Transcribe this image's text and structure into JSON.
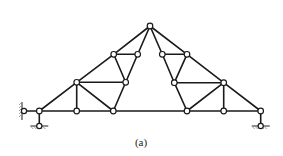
{
  "figure": {
    "caption": "(a)",
    "type": "roof-truss",
    "colors": {
      "line": "#1a1a1a",
      "joint_fill": "#ffffff",
      "background": "#ffffff"
    }
  },
  "truss": {
    "joints": [
      {
        "id": "A",
        "x": 39.3,
        "y": 111
      },
      {
        "id": "B",
        "x": 76.7,
        "y": 111
      },
      {
        "id": "C",
        "x": 113.3,
        "y": 111
      },
      {
        "id": "D",
        "x": 187,
        "y": 111
      },
      {
        "id": "E",
        "x": 223.7,
        "y": 111
      },
      {
        "id": "F",
        "x": 260.7,
        "y": 111
      },
      {
        "id": "G",
        "x": 76.7,
        "y": 82.3
      },
      {
        "id": "H",
        "x": 125.7,
        "y": 82.3
      },
      {
        "id": "I",
        "x": 174.3,
        "y": 82.7
      },
      {
        "id": "J",
        "x": 223.7,
        "y": 82.7
      },
      {
        "id": "K",
        "x": 113.7,
        "y": 54.3
      },
      {
        "id": "L",
        "x": 137.7,
        "y": 54.3
      },
      {
        "id": "M",
        "x": 162.3,
        "y": 54.3
      },
      {
        "id": "N",
        "x": 187,
        "y": 54.3
      },
      {
        "id": "P",
        "x": 150,
        "y": 26
      }
    ],
    "members": [
      [
        "A",
        "B"
      ],
      [
        "B",
        "C"
      ],
      [
        "C",
        "D"
      ],
      [
        "D",
        "E"
      ],
      [
        "E",
        "F"
      ],
      [
        "A",
        "G"
      ],
      [
        "G",
        "K"
      ],
      [
        "K",
        "P"
      ],
      [
        "P",
        "N"
      ],
      [
        "N",
        "J"
      ],
      [
        "J",
        "F"
      ],
      [
        "G",
        "B"
      ],
      [
        "G",
        "H"
      ],
      [
        "G",
        "C"
      ],
      [
        "H",
        "C"
      ],
      [
        "K",
        "L"
      ],
      [
        "K",
        "H"
      ],
      [
        "L",
        "H"
      ],
      [
        "L",
        "P"
      ],
      [
        "J",
        "E"
      ],
      [
        "J",
        "I"
      ],
      [
        "J",
        "D"
      ],
      [
        "I",
        "D"
      ],
      [
        "N",
        "M"
      ],
      [
        "N",
        "I"
      ],
      [
        "M",
        "I"
      ],
      [
        "M",
        "P"
      ]
    ],
    "supports": [
      {
        "type": "pin",
        "joint": "A",
        "x": 39.3,
        "y": 126
      },
      {
        "type": "roller-wall",
        "joint": "A",
        "x": 24,
        "y": 111
      },
      {
        "type": "pin",
        "joint": "F",
        "x": 260.7,
        "y": 126
      }
    ]
  }
}
